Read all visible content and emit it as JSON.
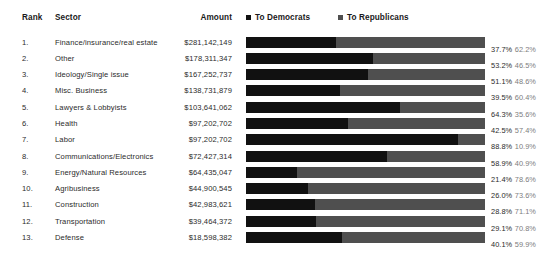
{
  "table": {
    "columns": {
      "rank": "Rank",
      "sector": "Sector",
      "amount": "Amount"
    }
  },
  "legend": {
    "items": [
      {
        "label": "To Democrats",
        "icon": "square-swatch-icon",
        "color": "#111111"
      },
      {
        "label": "To Republicans",
        "icon": "square-swatch-icon",
        "color": "#4f4f4f"
      }
    ]
  },
  "colors": {
    "democrat": "#111111",
    "republican": "#4f4f4f",
    "background": "#ffffff",
    "text": "#2b2b2b",
    "muted_text": "#7d7d7d"
  },
  "chart_data": {
    "type": "bar",
    "orientation": "horizontal",
    "stacked": true,
    "title": "",
    "xlabel": "",
    "ylabel": "",
    "xlim": [
      0,
      100
    ],
    "grid": false,
    "legend_position": "top-right",
    "categories": [
      "Finance/insurance/real estate",
      "Other",
      "Ideology/Single issue",
      "Misc. Business",
      "Lawyers & Lobbyists",
      "Health",
      "Labor",
      "Communications/Electronics",
      "Energy/Natural Resources",
      "Agribusiness",
      "Construction",
      "Transportation",
      "Defense"
    ],
    "series": [
      {
        "name": "To Democrats",
        "color": "#111111",
        "values": [
          37.7,
          53.2,
          51.1,
          39.5,
          64.3,
          42.5,
          88.8,
          58.9,
          21.4,
          26.0,
          28.8,
          29.1,
          40.1
        ]
      },
      {
        "name": "To Republicans",
        "color": "#4f4f4f",
        "values": [
          62.2,
          46.5,
          48.6,
          60.4,
          35.6,
          57.4,
          10.9,
          40.9,
          78.6,
          73.6,
          71.1,
          70.8,
          59.9
        ]
      }
    ],
    "amounts": [
      281142149,
      178311347,
      167252737,
      138731879,
      103641062,
      97202702,
      97202702,
      72427314,
      64435047,
      44900545,
      42983621,
      39464372,
      18598382
    ]
  },
  "rows": [
    {
      "rank": "1.",
      "sector": "Finance/insurance/real estate",
      "amount": "$281,142,149",
      "dem": 37.7,
      "rep": 62.2,
      "dem_label": "37.7%",
      "rep_label": "62.2%"
    },
    {
      "rank": "2.",
      "sector": "Other",
      "amount": "$178,311,347",
      "dem": 53.2,
      "rep": 46.5,
      "dem_label": "53.2%",
      "rep_label": "46.5%"
    },
    {
      "rank": "3.",
      "sector": "Ideology/Single issue",
      "amount": "$167,252,737",
      "dem": 51.1,
      "rep": 48.6,
      "dem_label": "51.1%",
      "rep_label": "48.6%"
    },
    {
      "rank": "4.",
      "sector": "Misc. Business",
      "amount": "$138,731,879",
      "dem": 39.5,
      "rep": 60.4,
      "dem_label": "39.5%",
      "rep_label": "60.4%"
    },
    {
      "rank": "5.",
      "sector": "Lawyers & Lobbyists",
      "amount": "$103,641,062",
      "dem": 64.3,
      "rep": 35.6,
      "dem_label": "64.3%",
      "rep_label": "35.6%"
    },
    {
      "rank": "6.",
      "sector": "Health",
      "amount": "$97,202,702",
      "dem": 42.5,
      "rep": 57.4,
      "dem_label": "42.5%",
      "rep_label": "57.4%"
    },
    {
      "rank": "7.",
      "sector": "Labor",
      "amount": "$97,202,702",
      "dem": 88.8,
      "rep": 10.9,
      "dem_label": "88.8%",
      "rep_label": "10.9%"
    },
    {
      "rank": "8.",
      "sector": "Communications/Electronics",
      "amount": "$72,427,314",
      "dem": 58.9,
      "rep": 40.9,
      "dem_label": "58.9%",
      "rep_label": "40.9%"
    },
    {
      "rank": "9.",
      "sector": "Energy/Natural Resources",
      "amount": "$64,435,047",
      "dem": 21.4,
      "rep": 78.6,
      "dem_label": "21.4%",
      "rep_label": "78.6%"
    },
    {
      "rank": "10.",
      "sector": "Agribusiness",
      "amount": "$44,900,545",
      "dem": 26.0,
      "rep": 73.6,
      "dem_label": "26.0%",
      "rep_label": "73.6%"
    },
    {
      "rank": "11.",
      "sector": "Construction",
      "amount": "$42,983,621",
      "dem": 28.8,
      "rep": 71.1,
      "dem_label": "28.8%",
      "rep_label": "71.1%"
    },
    {
      "rank": "12.",
      "sector": "Transportation",
      "amount": "$39,464,372",
      "dem": 29.1,
      "rep": 70.8,
      "dem_label": "29.1%",
      "rep_label": "70.8%"
    },
    {
      "rank": "13.",
      "sector": "Defense",
      "amount": "$18,598,382",
      "dem": 40.1,
      "rep": 59.9,
      "dem_label": "40.1%",
      "rep_label": "59.9%"
    }
  ]
}
